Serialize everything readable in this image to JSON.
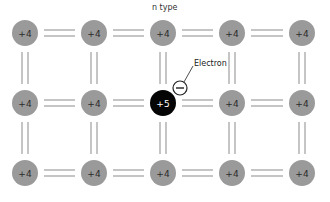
{
  "diagram": {
    "title": "n type",
    "electron_label": "Electron",
    "electron_symbol": "−",
    "colors": {
      "atom_fill": "#9a9a9a",
      "donor_fill": "#050505",
      "bond": "#9e9e9e",
      "text_dark": "#2a2a2a",
      "text_light": "#ffffff"
    },
    "grid": {
      "cols": [
        25,
        94,
        163,
        232,
        302
      ],
      "rows": [
        33,
        103,
        173
      ],
      "radius": 13
    },
    "atoms": [
      {
        "row": 0,
        "col": 0,
        "label": "+4",
        "type": "host"
      },
      {
        "row": 0,
        "col": 1,
        "label": "+4",
        "type": "host"
      },
      {
        "row": 0,
        "col": 2,
        "label": "+4",
        "type": "host"
      },
      {
        "row": 0,
        "col": 3,
        "label": "+4",
        "type": "host"
      },
      {
        "row": 0,
        "col": 4,
        "label": "+4",
        "type": "host"
      },
      {
        "row": 1,
        "col": 0,
        "label": "+4",
        "type": "host"
      },
      {
        "row": 1,
        "col": 1,
        "label": "+4",
        "type": "host"
      },
      {
        "row": 1,
        "col": 2,
        "label": "+5",
        "type": "donor"
      },
      {
        "row": 1,
        "col": 3,
        "label": "+4",
        "type": "host"
      },
      {
        "row": 1,
        "col": 4,
        "label": "+4",
        "type": "host"
      },
      {
        "row": 2,
        "col": 0,
        "label": "+4",
        "type": "host"
      },
      {
        "row": 2,
        "col": 1,
        "label": "+4",
        "type": "host"
      },
      {
        "row": 2,
        "col": 2,
        "label": "+4",
        "type": "host"
      },
      {
        "row": 2,
        "col": 3,
        "label": "+4",
        "type": "host"
      },
      {
        "row": 2,
        "col": 4,
        "label": "+4",
        "type": "host"
      }
    ],
    "free_electron": {
      "x": 180,
      "y": 88,
      "r": 7
    }
  }
}
